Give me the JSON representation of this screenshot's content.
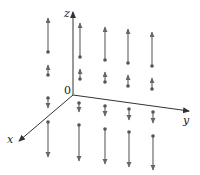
{
  "figure": {
    "type": "3d-vector-field",
    "axes": {
      "x_label": "x",
      "y_label": "y",
      "z_label": "z",
      "origin_label": "0",
      "origin": [
        73,
        95
      ],
      "z_end": [
        73,
        12
      ],
      "y_end": [
        189,
        111
      ],
      "x_end": [
        19,
        141
      ]
    },
    "colors": {
      "axis": "#333333",
      "arrow": "#777777",
      "dot": "#555555",
      "text": "#222222"
    },
    "arrows": [
      {
        "x": 48,
        "y1": 52,
        "y2": 18
      },
      {
        "x": 80,
        "y1": 57,
        "y2": 23
      },
      {
        "x": 105,
        "y1": 60,
        "y2": 27
      },
      {
        "x": 128,
        "y1": 63,
        "y2": 29
      },
      {
        "x": 152,
        "y1": 66,
        "y2": 32
      },
      {
        "x": 48,
        "y1": 75,
        "y2": 65
      },
      {
        "x": 80,
        "y1": 79,
        "y2": 69
      },
      {
        "x": 105,
        "y1": 82,
        "y2": 72
      },
      {
        "x": 128,
        "y1": 86,
        "y2": 75
      },
      {
        "x": 152,
        "y1": 89,
        "y2": 78
      },
      {
        "x": 48,
        "y1": 98,
        "y2": 108
      },
      {
        "x": 79,
        "y1": 103,
        "y2": 112
      },
      {
        "x": 105,
        "y1": 106,
        "y2": 116
      },
      {
        "x": 129,
        "y1": 109,
        "y2": 120
      },
      {
        "x": 153,
        "y1": 112,
        "y2": 123
      },
      {
        "x": 48,
        "y1": 122,
        "y2": 157
      },
      {
        "x": 79,
        "y1": 125,
        "y2": 161
      },
      {
        "x": 105,
        "y1": 129,
        "y2": 164
      },
      {
        "x": 129,
        "y1": 132,
        "y2": 167
      },
      {
        "x": 153,
        "y1": 136,
        "y2": 170
      }
    ]
  }
}
